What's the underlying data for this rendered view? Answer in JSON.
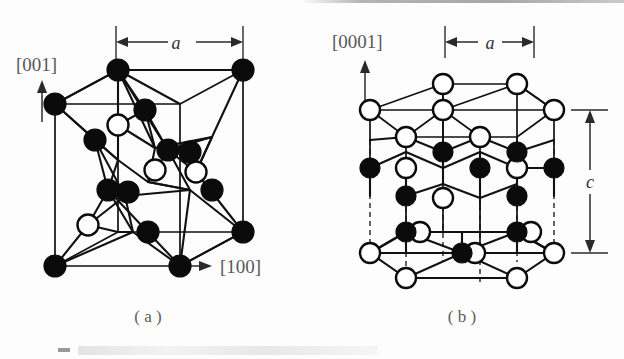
{
  "figure": {
    "panels": [
      {
        "id": "a",
        "caption": "( a )",
        "structure_name": "zincblende-cubic",
        "direction_labels": [
          {
            "text": "[001]",
            "arrow": "up"
          },
          {
            "text": "[100]",
            "arrow": "right"
          }
        ],
        "dimensions": [
          {
            "symbol": "a",
            "orientation": "horizontal",
            "position": "top"
          }
        ]
      },
      {
        "id": "b",
        "caption": "( b )",
        "structure_name": "wurtzite-hexagonal",
        "direction_labels": [
          {
            "text": "[0001]",
            "arrow": "up"
          }
        ],
        "dimensions": [
          {
            "symbol": "a",
            "orientation": "horizontal",
            "position": "top"
          },
          {
            "symbol": "c",
            "orientation": "vertical",
            "position": "right"
          }
        ]
      }
    ],
    "legend": {
      "dark_atom": "filled-circle-atom",
      "open_atom": "open-circle-atom"
    },
    "colors": {
      "atom_dark": "#0b0b0b",
      "atom_open": "#ffffff",
      "bond": "#111111",
      "label": "#58585a"
    }
  }
}
